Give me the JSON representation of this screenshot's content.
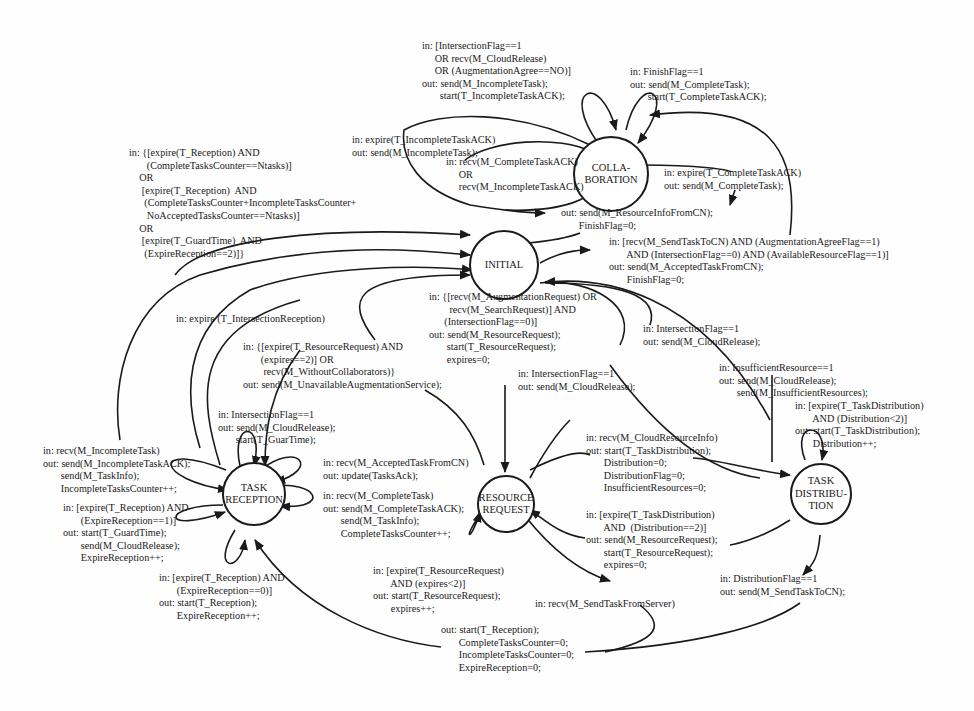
{
  "diagram": {
    "type": "state-machine",
    "states": {
      "collaboration": "COLLA-\nBORATION",
      "initial": "INITIAL",
      "task_reception": "TASK\nRECEPTION",
      "resource_request": "RESOURCE\nREQUEST",
      "task_distribution": "TASK\nDISTRIBU-\nTION"
    },
    "transitions": {
      "collab_self_incomplete": "in: [IntersectionFlag==1\n     OR recv(M_CloudRelease)\n     OR (AugmentationAgree==NO)]\nout: send(M_IncompleteTask);\n       start(T_IncompleteTaskACK);",
      "collab_self_finish": "in: FinishFlag==1\nout: send(M_CompleteTask);\n       start(T_CompleteTaskACK);",
      "collab_expire_incomplete_ack": "in: expire(T_IncompleteTaskACK)\nout: send(M_IncompleteTask);",
      "collab_recv_ack": "in: recv(M_CompleteTaskACK)\n     OR\n     recv(M_IncompleteTaskACK)",
      "collab_expire_complete_ack": "in: expire(T_CompleteTaskACK)\nout: send(M_CompleteTask);",
      "collab_to_initial_out": "out: send(M_ResourceInfoFromCN);\n       FinishFlag=0;",
      "initial_to_collab": "in: [recv(M_SendTaskToCN) AND (AugmentationAgreeFlag==1)\n       AND (IntersectionFlag==0) AND (AvailableResourceFlag==1)]\nout: send(M_AcceptedTaskFromCN);\n       FinishFlag=0;",
      "reception_to_initial": "in: {[expire(T_Reception) AND\n       (CompleteTasksCounter==Ntasks)]\n    OR\n     [expire(T_Reception)  AND\n      (CompleteTasksCounter+IncompleteTasksCounter+\n       NoAcceptedTasksCounter==Ntasks)]\n    OR\n     [expire(T_GuardTime)  AND\n      (ExpireReception==2)]}",
      "reception_intersection_expire": "in: expire (T_IntersectionReception)",
      "request_to_initial_unavailable": "in: {[expire(T_ResourceRequest) AND\n       (expires==2)] OR\n        recv(M_WithoutCollaborators)}\nout: send(M_UnavailableAugmentationService);",
      "initial_to_request": "in: {[recv(M_AugmentationRequest) OR\n        recv(M_SearchRequest)] AND\n      (IntersectionFlag==0)]\nout: send(M_ResourceRequest);\n       start(T_ResourceRequest);\n       expires=0;",
      "request_intersection": "in: IntersectionFlag==1\nout: send(M_CloudRelease);",
      "distribution_intersection": "in: IntersectionFlag==1\nout: send(M_CloudRelease);",
      "distribution_insufficient": "in: InsufficientResource==1\nout: send(M_CloudRelease);\n       send(M_InsufficientResources);",
      "distribution_self_expire": "in: [expire(T_TaskDistribution)\n       AND (Distribution<2)]\nout: start(T_TaskDistribution);\n       Distribution++;",
      "reception_self_intersection": "in: IntersectionFlag==1\nout: send(M_CloudRelease);\n       start(T_GuarTime);",
      "reception_self_incomplete": "in: recv(M_IncompleteTask)\nout: send(M_IncompleteTaskACK);\n       send(M_TaskInfo);\n       IncompleteTasksCounter++;",
      "reception_self_accepted": "in: recv(M_AcceptedTaskFromCN)\nout: update(TasksAck);",
      "reception_self_complete": "in: recv(M_CompleteTask)\nout: send(M_CompleteTaskACK);\n       send(M_TaskInfo);\n       CompleteTasksCounter++;",
      "reception_self_expire1": "in: [expire(T_Reception) AND\n       (ExpireReception==1)]\nout: start(T_GuardTime);\n       send(M_CloudRelease);\n       ExpireReception++;",
      "reception_self_expire0": "in: [expire(T_Reception) AND\n       (ExpireReception==0)]\nout: start(T_Reception);\n       ExpireReception++;",
      "request_to_distribution": "in: recv(M_CloudResourceInfo)\nout: start(T_TaskDistribution);\n       Distribution=0;\n       DistributionFlag=0;\n       InsufficientResources=0;",
      "distribution_to_request": "in: [expire(T_TaskDistribution)\n       AND  (Distribution==2)]\nout: send(M_ResourceRequest);\n       start(T_ResourceRequest);\n       expires=0;",
      "request_self_expire": "in: [expire(T_ResourceRequest)\n       AND (expires<2)]\nout: start(T_ResourceRequest);\n       expires++;",
      "request_send_task_from_server": "in: recv(M_SendTaskFromServer)",
      "distribution_flag": "in: DistributionFlag==1\nout: send(M_SendTaskToCN);",
      "to_reception_out": "out: start(T_Reception);\n       CompleteTasksCounter=0;\n       IncompleteTasksCounter=0;\n       ExpireReception=0;"
    },
    "colors": {
      "stroke": "#1a1a1a",
      "background": "#fefefe"
    }
  }
}
